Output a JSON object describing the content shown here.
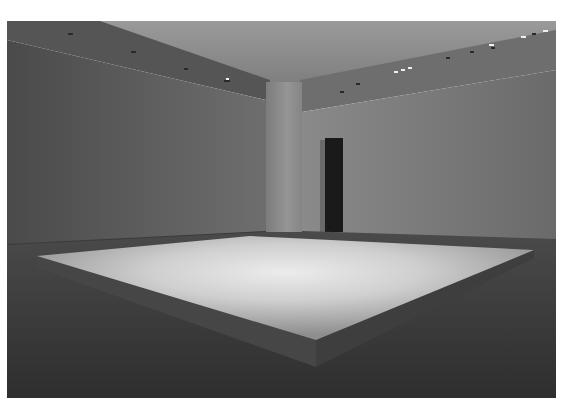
{
  "image": {
    "kind": "photograph",
    "subject": "empty gallery room with large low illuminated square floor platform",
    "palette": {
      "ceiling": "#8a8a8a",
      "wall_left": "#5e5e5e",
      "wall_right": "#7a7a7a",
      "pillar": "#8c8c8c",
      "doorway": "#1a1a1a",
      "floor": "#3c3c3c",
      "platform_top_center": "#e4e4e4",
      "platform_top_edge": "#9a9a9a",
      "platform_side": "#4a4a4a",
      "frame_margin": "#ffffff"
    }
  }
}
